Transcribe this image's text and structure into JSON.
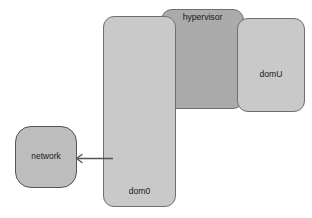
{
  "diagram": {
    "type": "block-diagram",
    "palette": {
      "page_background": "#ffffff",
      "container_light": "#c9c9c9",
      "container_mid": "#ababab",
      "leaf_fill": "#bdbdbd",
      "shared_memory_fill": "#8e8e8e",
      "stroke": "#555555",
      "text": "#1a1a1a"
    },
    "containers": [
      {
        "id": "dom0",
        "label": "dom0",
        "label_position": "bottom"
      },
      {
        "id": "hypervisor",
        "label": "hypervisor",
        "label_position": "top"
      },
      {
        "id": "domU",
        "label": "domU",
        "label_position": "bottom"
      }
    ],
    "nodes": {
      "network": "network",
      "netback": "netback",
      "bridge": "bridge",
      "net_stack": "net stack",
      "net_driver": "net driver",
      "shared_memory_line1": "shared",
      "shared_memory_line2": "memory",
      "netfront": "netfront"
    },
    "connections": [
      {
        "id": "netdriver-to-network",
        "from": "net driver",
        "to": "network",
        "direction": "left",
        "arrowhead": "single",
        "style": "solid"
      }
    ]
  }
}
